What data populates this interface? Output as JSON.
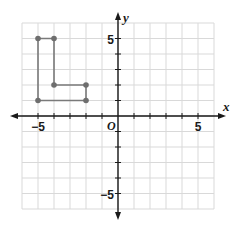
{
  "chart_data": {
    "type": "scatter",
    "subtype": "coordinate-plane-polygon",
    "title": "",
    "xlabel": "x",
    "ylabel": "y",
    "origin_label": "O",
    "xlim": [
      -6,
      6
    ],
    "ylim": [
      -6,
      6
    ],
    "grid": true,
    "x_tick_labels": [
      {
        "value": -5,
        "label": "−5"
      },
      {
        "value": 5,
        "label": "5"
      }
    ],
    "y_tick_labels": [
      {
        "value": 5,
        "label": "5"
      },
      {
        "value": -5,
        "label": "−5"
      }
    ],
    "series": [
      {
        "name": "L-shaped polygon",
        "closed": true,
        "points": [
          [
            -5,
            5
          ],
          [
            -4,
            5
          ],
          [
            -4,
            2
          ],
          [
            -2,
            2
          ],
          [
            -2,
            1
          ],
          [
            -5,
            1
          ]
        ]
      }
    ],
    "colors": {
      "grid": "#d9d9d9",
      "axis": "#1a1a1a",
      "polygon": "#7a7a7a",
      "vertex": "#6e6e6e"
    }
  }
}
